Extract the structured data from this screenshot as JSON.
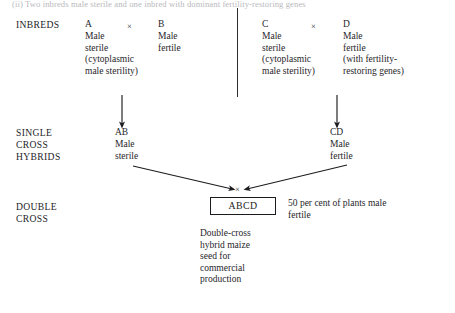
{
  "figure": {
    "heading": "(ii) Two inbreds male sterile and one inbred with dominant fertility-restoring genes",
    "row_labels": {
      "inbreds": "INBREDS",
      "single_cross": "SINGLE\nCROSS\nHYBRIDS",
      "double_cross": "DOUBLE\nCROSS"
    },
    "cross_symbol": "×",
    "inbreds": [
      {
        "code": "A",
        "description": "Male\nsterile\n(cytoplasmic\nmale sterility)"
      },
      {
        "code": "B",
        "description": "Male\nfertile"
      },
      {
        "code": "C",
        "description": "Male\nsterile\n(cytoplasmic\nmale sterility)"
      },
      {
        "code": "D",
        "description": "Male\nfertile\n(with fertility-\nrestoring genes)"
      }
    ],
    "single_cross_hybrids": [
      {
        "code": "AB",
        "description": "Male\nsterile"
      },
      {
        "code": "CD",
        "description": "Male\nfertile"
      }
    ],
    "double_cross": {
      "code": "ABCD",
      "note": "50 per cent of plants male\nfertile",
      "caption": "Double-cross\nhybrid maize\nseed for\ncommercial\nproduction"
    },
    "colors": {
      "ink": "#26262a",
      "line": "#1c1c20",
      "background": "#ffffff",
      "faded_heading": "#b9b9bd"
    }
  }
}
